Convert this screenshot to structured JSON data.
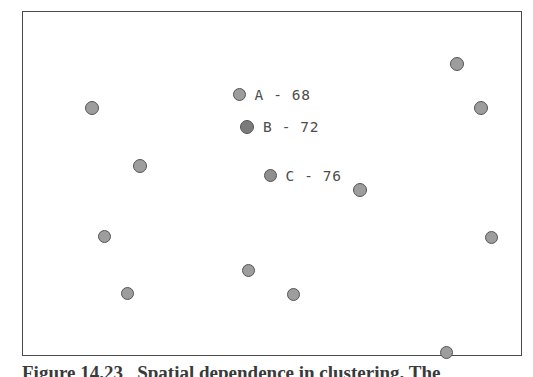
{
  "figure": {
    "caption": "Figure 14.23   Spatial dependence in clustering. The",
    "frame_color": "#4a4a4a",
    "background": "#ffffff",
    "marker_fill": "#9d9d9d",
    "marker_fill_dark": "#7b7b7b",
    "marker_stroke": "#555555",
    "text_color": "#4d4d4d"
  },
  "annotations": [
    {
      "id": "annotation-a",
      "label": "A - 68",
      "value": 68,
      "name": "A",
      "x": 239,
      "y": 96,
      "marker_size": 13,
      "fill": "#9d9d9d"
    },
    {
      "id": "annotation-b",
      "label": "B - 72",
      "value": 72,
      "name": "B",
      "x": 247,
      "y": 129,
      "marker_size": 14,
      "fill": "#7b7b7b"
    },
    {
      "id": "annotation-c",
      "label": "C - 76",
      "value": 76,
      "name": "C",
      "x": 270,
      "y": 177,
      "marker_size": 13,
      "fill": "#8f8f8f"
    }
  ],
  "chart_data": {
    "type": "scatter",
    "title": "Spatial dependence in clustering",
    "xlabel": "",
    "ylabel": "",
    "grid": false,
    "legend": "none",
    "axis_ticks": false,
    "xlim": [
      22,
      522
    ],
    "ylim": [
      11,
      356
    ],
    "series": [
      {
        "name": "data points",
        "marker": "filled-circle",
        "color": "#9d9d9d",
        "points": [
          {
            "x": 457,
            "y": 64,
            "r": 7.0
          },
          {
            "x": 92,
            "y": 108,
            "r": 7.0
          },
          {
            "x": 481,
            "y": 108,
            "r": 7.0
          },
          {
            "x": 140,
            "y": 166,
            "r": 7.0
          },
          {
            "x": 360,
            "y": 190,
            "r": 7.0
          },
          {
            "x": 104,
            "y": 236,
            "r": 6.5
          },
          {
            "x": 491,
            "y": 237,
            "r": 6.5
          },
          {
            "x": 248,
            "y": 270,
            "r": 6.5
          },
          {
            "x": 127,
            "y": 293,
            "r": 6.5
          },
          {
            "x": 293,
            "y": 294,
            "r": 6.5
          },
          {
            "x": 446,
            "y": 352,
            "r": 6.5
          }
        ]
      },
      {
        "name": "labeled points",
        "marker": "filled-circle",
        "color": "#8f8f8f",
        "points": [
          {
            "x": 239,
            "y": 96,
            "r": 6.5,
            "label": "A - 68"
          },
          {
            "x": 247,
            "y": 129,
            "r": 7.0,
            "label": "B - 72"
          },
          {
            "x": 270,
            "y": 177,
            "r": 6.5,
            "label": "C - 76"
          }
        ]
      }
    ]
  }
}
